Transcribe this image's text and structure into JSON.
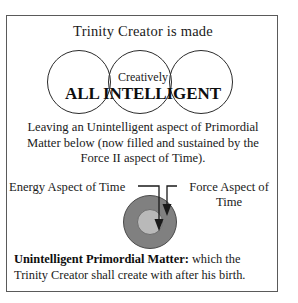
{
  "figure": {
    "title": "Trinity Creator is made",
    "venn": {
      "overlay_small_label": "Creatively",
      "overlay_large_label": "ALL INTELLIGENT",
      "circle_count": 3,
      "circle_names": [
        "left-circle",
        "middle-circle",
        "right-circle"
      ]
    },
    "middle_paragraph": "Leaving an Unintelligent aspect of Primordial Matter below (now filled and sustained by the Force II aspect of Time).",
    "lower_diagram": {
      "left_label": "Energy Aspect of Time",
      "right_label": "Force Aspect of Time",
      "outer_ring_color": "#808080",
      "inner_ring_color": "#b9b9b9",
      "arrow_color": "#1a1a1a",
      "arrow_count": 2
    },
    "caption": {
      "bold_lead": "Unintelligent Primordial Matter:",
      "body": " which the Trinity Creator shall create with after his birth."
    },
    "colors": {
      "border": "#5a5a5a",
      "stroke": "#2b2b2b",
      "text": "#1a1a1a",
      "background": "#ffffff"
    }
  }
}
